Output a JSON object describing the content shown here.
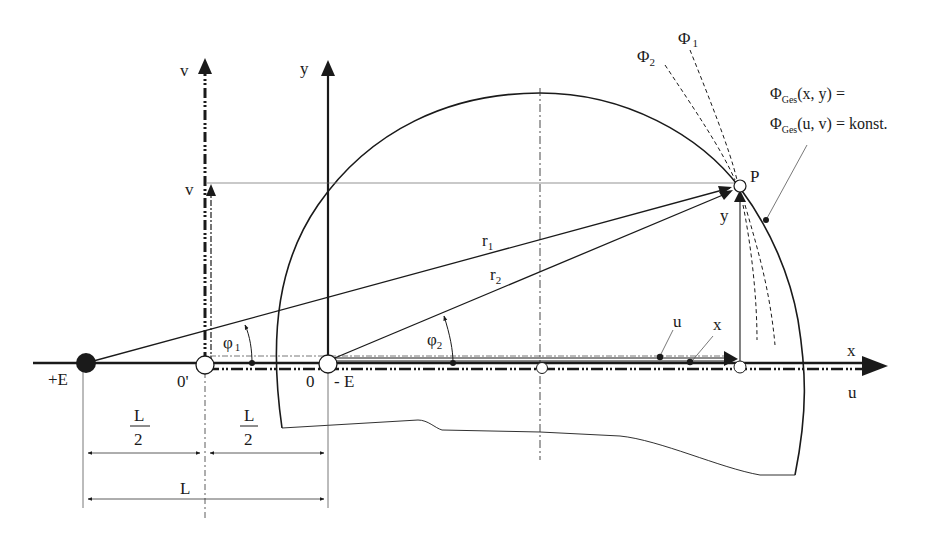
{
  "colors": {
    "ink": "#1a1a1a",
    "background": "#ffffff",
    "thin_line": "#555555"
  },
  "axes": {
    "v_axis_label": "v",
    "y_axis_label": "y",
    "x_axis_label": "x",
    "u_axis_label": "u"
  },
  "points": {
    "positive_charge": "+E",
    "origin_prime": "0'",
    "origin": "0",
    "negative_charge": "- E",
    "point_p": "P"
  },
  "projections": {
    "v_coord": "v",
    "y_coord": "y",
    "u_coord": "u",
    "x_coord": "x"
  },
  "radii": {
    "r1": {
      "base": "r",
      "sub": "1"
    },
    "r2": {
      "base": "r",
      "sub": "2"
    }
  },
  "angles": {
    "phi1": {
      "base": "φ",
      "sub": "1"
    },
    "phi2": {
      "base": "φ",
      "sub": "2"
    }
  },
  "potentials": {
    "phi1": {
      "base": "Φ",
      "sub": "1"
    },
    "phi2": {
      "base": "Φ",
      "sub": "2"
    }
  },
  "annotation": {
    "line1_base": "Φ",
    "line1_sub": "Ges",
    "line1_rest": "(x, y) =",
    "line2_base": "Φ",
    "line2_sub": "Ges",
    "line2_rest": "(u, v) = konst."
  },
  "dimensions": {
    "half_left_num": "L",
    "half_left_den": "2",
    "half_right_num": "L",
    "half_right_den": "2",
    "full": "L"
  }
}
